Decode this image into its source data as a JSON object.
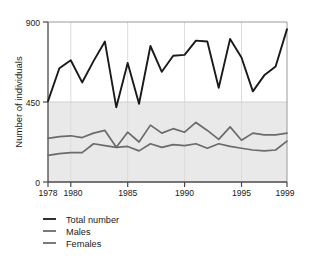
{
  "chart_data": {
    "type": "line",
    "title": "",
    "xlabel": "",
    "ylabel": "Number of individuals",
    "xlim": [
      1978,
      1999
    ],
    "ylim": [
      0,
      900
    ],
    "yticks": [
      0,
      450,
      900
    ],
    "ytick_labels": [
      "0",
      "450",
      "900"
    ],
    "xticks": [
      1978,
      1980,
      1985,
      1990,
      1995,
      1999
    ],
    "xtick_labels": [
      "1978",
      "1980",
      "1985",
      "1990",
      "1995",
      "1999"
    ],
    "grid": "vertical-light",
    "legend_position": "below-left",
    "x": [
      1978,
      1979,
      1980,
      1981,
      1982,
      1983,
      1984,
      1985,
      1986,
      1987,
      1988,
      1989,
      1990,
      1991,
      1992,
      1993,
      1994,
      1995,
      1996,
      1997,
      1998,
      1999
    ],
    "series": [
      {
        "name": "Total number",
        "color": "#1a1a1a",
        "values": [
          455,
          640,
          685,
          560,
          680,
          790,
          420,
          670,
          440,
          765,
          620,
          710,
          715,
          795,
          790,
          530,
          805,
          700,
          510,
          600,
          650,
          860
        ]
      },
      {
        "name": "Males",
        "color": "#6b6b6b",
        "values": [
          245,
          255,
          260,
          250,
          275,
          290,
          195,
          280,
          225,
          320,
          275,
          300,
          280,
          335,
          290,
          240,
          310,
          235,
          275,
          265,
          265,
          275
        ]
      },
      {
        "name": "Females",
        "color": "#6b6b6b",
        "values": [
          150,
          160,
          165,
          165,
          215,
          205,
          195,
          200,
          175,
          215,
          195,
          210,
          205,
          215,
          190,
          215,
          200,
          190,
          180,
          175,
          180,
          230
        ]
      }
    ]
  },
  "axis": {
    "y_label": "Number of individuals",
    "y_ticks": [
      "900",
      "450",
      "0"
    ],
    "x_ticks": [
      "1978",
      "1980",
      "1985",
      "1990",
      "1995",
      "1999"
    ]
  },
  "legend": {
    "items": [
      {
        "label": "Total number",
        "color": "#1a1a1a"
      },
      {
        "label": "Males",
        "color": "#6b6b6b"
      },
      {
        "label": "Females",
        "color": "#6b6b6b"
      }
    ]
  },
  "style": {
    "plot_background_upper": "#ffffff",
    "plot_background_lower": "#e9e9e9",
    "axis_color": "#555555",
    "gridline_color": "#dddddd"
  }
}
